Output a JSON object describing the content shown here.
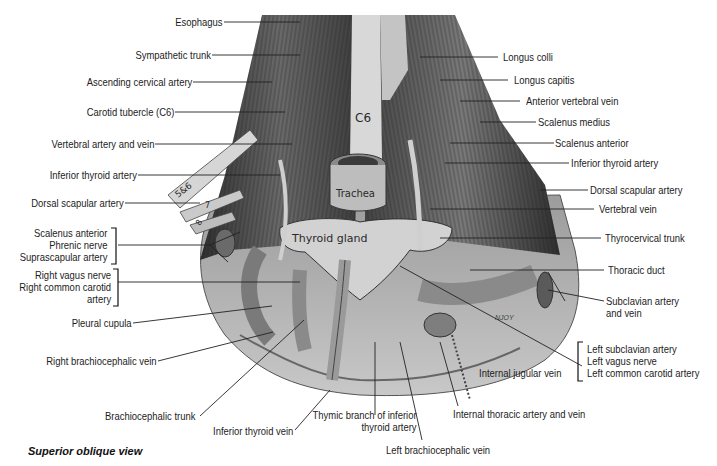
{
  "figure": {
    "caption": "Superior oblique view",
    "artist_signature": "NJOY",
    "illustration_labels": {
      "vertebra": "C6",
      "trachea": "Trachea",
      "thyroid": "Thyroid gland",
      "rib_5_6": "5&6",
      "rib_7": "7",
      "rib_8": "8"
    },
    "left_labels": [
      {
        "id": "esophagus",
        "text": "Esophagus"
      },
      {
        "id": "sympathetic-trunk",
        "text": "Sympathetic trunk"
      },
      {
        "id": "ascending-cervical-artery",
        "text": "Ascending cervical artery"
      },
      {
        "id": "carotid-tubercle",
        "text": "Carotid tubercle (C6)"
      },
      {
        "id": "vertebral-artery-vein",
        "text": "Vertebral artery and vein"
      },
      {
        "id": "inferior-thyroid-artery-left",
        "text": "Inferior thyroid artery"
      },
      {
        "id": "dorsal-scapular-artery-left",
        "text": "Dorsal scapular artery"
      },
      {
        "id": "scalenus-group",
        "lines": [
          "Scalenus anterior",
          "Phrenic nerve",
          "Suprascapular artery"
        ]
      },
      {
        "id": "right-vagus-group",
        "lines": [
          "Right vagus nerve",
          "Right common carotid",
          "artery"
        ]
      },
      {
        "id": "pleural-cupula",
        "text": "Pleural cupula"
      },
      {
        "id": "right-brachiocephalic-vein",
        "text": "Right brachiocephalic vein"
      }
    ],
    "right_labels": [
      {
        "id": "longus-colli",
        "text": "Longus colli"
      },
      {
        "id": "longus-capitis",
        "text": "Longus capitis"
      },
      {
        "id": "anterior-vertebral-vein",
        "text": "Anterior vertebral vein"
      },
      {
        "id": "scalenus-medius",
        "text": "Scalenus medius"
      },
      {
        "id": "scalenus-anterior",
        "text": "Scalenus anterior"
      },
      {
        "id": "inferior-thyroid-artery-right",
        "text": "Inferior thyroid artery"
      },
      {
        "id": "dorsal-scapular-artery-right",
        "text": "Dorsal scapular artery"
      },
      {
        "id": "vertebral-vein",
        "text": "Vertebral vein"
      },
      {
        "id": "thyrocervical-trunk",
        "text": "Thyrocervical trunk"
      },
      {
        "id": "thoracic-duct",
        "text": "Thoracic duct"
      },
      {
        "id": "subclavian-artery-vein",
        "lines": [
          "Subclavian artery",
          "and vein"
        ]
      },
      {
        "id": "left-vessels-group",
        "lines": [
          "Left subclavian artery",
          "Left vagus nerve",
          "Left common carotid artery"
        ]
      },
      {
        "id": "internal-jugular-vein",
        "text": "Internal jugular vein"
      }
    ],
    "bottom_labels": [
      {
        "id": "brachiocephalic-trunk",
        "text": "Brachiocephalic trunk"
      },
      {
        "id": "inferior-thyroid-vein",
        "text": "Inferior thyroid vein"
      },
      {
        "id": "thymic-branch",
        "lines": [
          "Thymic branch of inferior",
          "thyroid artery"
        ]
      },
      {
        "id": "left-brachiocephalic-vein",
        "text": "Left brachiocephalic vein"
      },
      {
        "id": "internal-thoracic",
        "text": "Internal thoracic artery and vein"
      }
    ],
    "colors": {
      "background": "#ffffff",
      "label_text": "#1c1c1c",
      "leader_line": "#222222",
      "tissue_dark": "#3a3a3a",
      "tissue_mid": "#8a8a8a",
      "tissue_light": "#cfcfcf"
    }
  }
}
